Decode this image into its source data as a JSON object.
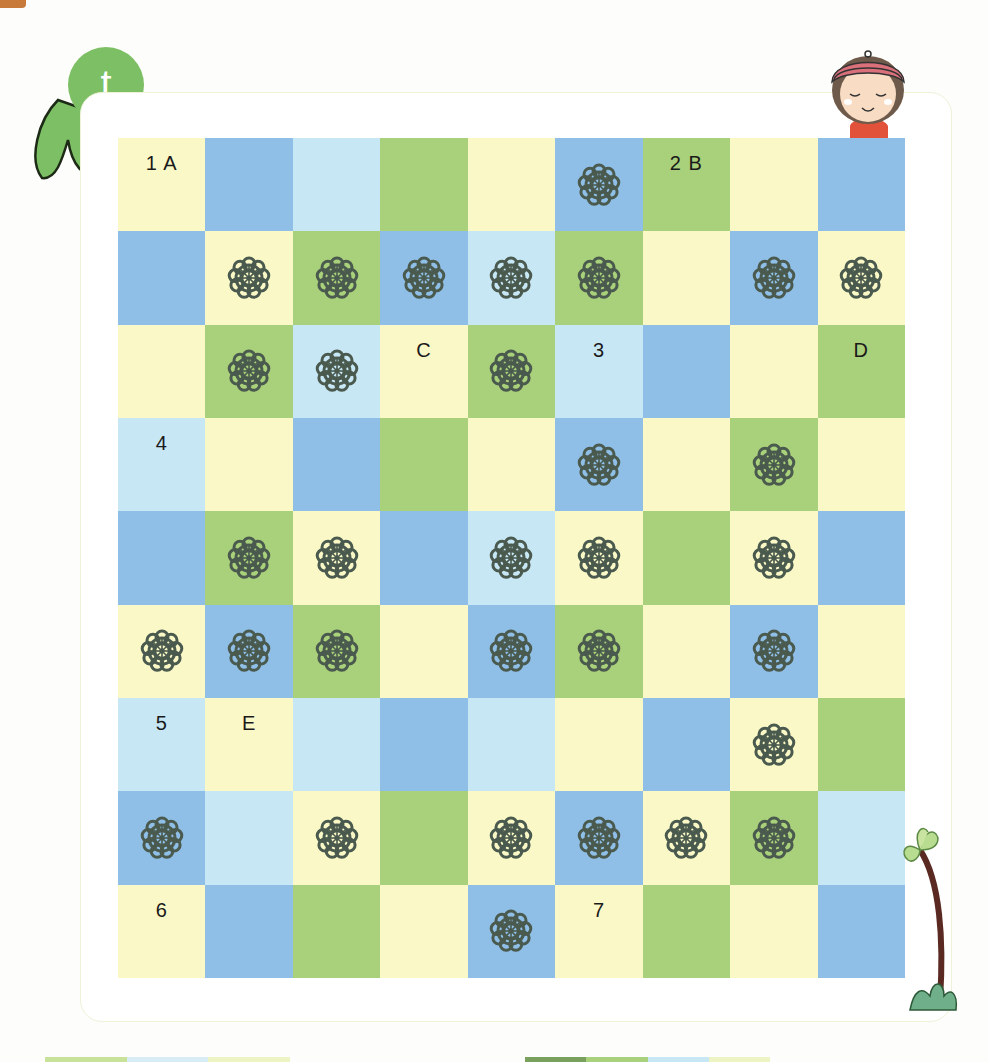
{
  "page": {
    "badge_letter": "t",
    "colors": {
      "Y": "#faf8c6",
      "B": "#8fbfe6",
      "L": "#c8e7f5",
      "G": "#a9d07a",
      "flower": "#4a5a4e",
      "badge": "#7cbf64"
    }
  },
  "board": {
    "rows": 9,
    "cols": 9,
    "cells": [
      [
        {
          "c": "Y",
          "label": "1 A"
        },
        {
          "c": "B"
        },
        {
          "c": "L"
        },
        {
          "c": "G"
        },
        {
          "c": "Y"
        },
        {
          "c": "B",
          "flower": true
        },
        {
          "c": "G",
          "label": "2 B"
        },
        {
          "c": "Y"
        },
        {
          "c": "B"
        }
      ],
      [
        {
          "c": "B"
        },
        {
          "c": "Y",
          "flower": true
        },
        {
          "c": "G",
          "flower": true
        },
        {
          "c": "B",
          "flower": true
        },
        {
          "c": "L",
          "flower": true
        },
        {
          "c": "G",
          "flower": true
        },
        {
          "c": "Y"
        },
        {
          "c": "B",
          "flower": true
        },
        {
          "c": "Y",
          "flower": true
        }
      ],
      [
        {
          "c": "Y"
        },
        {
          "c": "G",
          "flower": true
        },
        {
          "c": "L",
          "flower": true
        },
        {
          "c": "Y",
          "label": "C"
        },
        {
          "c": "G",
          "flower": true
        },
        {
          "c": "L",
          "label": "3"
        },
        {
          "c": "B"
        },
        {
          "c": "Y"
        },
        {
          "c": "G",
          "label": "D"
        }
      ],
      [
        {
          "c": "L",
          "label": "4"
        },
        {
          "c": "Y"
        },
        {
          "c": "B"
        },
        {
          "c": "G"
        },
        {
          "c": "Y"
        },
        {
          "c": "B",
          "flower": true
        },
        {
          "c": "Y"
        },
        {
          "c": "G",
          "flower": true
        },
        {
          "c": "Y"
        }
      ],
      [
        {
          "c": "B"
        },
        {
          "c": "G",
          "flower": true
        },
        {
          "c": "Y",
          "flower": true
        },
        {
          "c": "B"
        },
        {
          "c": "L",
          "flower": true
        },
        {
          "c": "Y",
          "flower": true
        },
        {
          "c": "G"
        },
        {
          "c": "Y",
          "flower": true
        },
        {
          "c": "B"
        }
      ],
      [
        {
          "c": "Y",
          "flower": true
        },
        {
          "c": "B",
          "flower": true
        },
        {
          "c": "G",
          "flower": true
        },
        {
          "c": "Y"
        },
        {
          "c": "B",
          "flower": true
        },
        {
          "c": "G",
          "flower": true
        },
        {
          "c": "Y"
        },
        {
          "c": "B",
          "flower": true
        },
        {
          "c": "Y"
        }
      ],
      [
        {
          "c": "L",
          "label": "5"
        },
        {
          "c": "Y",
          "label": "E"
        },
        {
          "c": "L"
        },
        {
          "c": "B"
        },
        {
          "c": "L"
        },
        {
          "c": "Y"
        },
        {
          "c": "B"
        },
        {
          "c": "Y",
          "flower": true
        },
        {
          "c": "G"
        }
      ],
      [
        {
          "c": "B",
          "flower": true
        },
        {
          "c": "L"
        },
        {
          "c": "Y",
          "flower": true
        },
        {
          "c": "G"
        },
        {
          "c": "Y",
          "flower": true
        },
        {
          "c": "B",
          "flower": true
        },
        {
          "c": "Y",
          "flower": true
        },
        {
          "c": "G",
          "flower": true
        },
        {
          "c": "L"
        }
      ],
      [
        {
          "c": "Y",
          "label": "6"
        },
        {
          "c": "B"
        },
        {
          "c": "G"
        },
        {
          "c": "Y"
        },
        {
          "c": "B",
          "flower": true
        },
        {
          "c": "Y",
          "label": "7"
        },
        {
          "c": "G"
        },
        {
          "c": "Y"
        },
        {
          "c": "B"
        }
      ]
    ]
  },
  "bottom_bars": [
    {
      "left": 45,
      "width": 245,
      "colors": [
        "#c9e29a",
        "#d7ecf4",
        "#eef3c4"
      ]
    },
    {
      "left": 525,
      "width": 245,
      "colors": [
        "#7aa05e",
        "#a9d07a",
        "#c8e7f5",
        "#eef3c4"
      ]
    }
  ]
}
